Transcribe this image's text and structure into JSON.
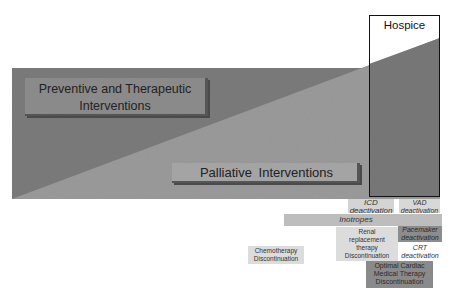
{
  "diagram": {
    "type": "care-transition-diagram",
    "regions": {
      "preventive": {
        "label": "Preventive and Therapeutic Interventions",
        "color": "#7b7b7b"
      },
      "palliative": {
        "label": "Palliative  Interventions",
        "color": "#9a9a9a"
      },
      "hospice": {
        "label": "Hospice"
      }
    },
    "labels": {
      "preventive_line1": "Preventive and Therapeutic",
      "preventive_line2": "Interventions",
      "palliative": "Palliative  Interventions",
      "hospice": "Hospice"
    },
    "interventions": [
      {
        "id": "icd",
        "line1": "ICD",
        "line2": "deactivation",
        "italic": true
      },
      {
        "id": "vad",
        "line1": "VAD",
        "line2": "deactivation",
        "italic": true
      },
      {
        "id": "inotropes",
        "line1": "Inotropes",
        "italic": true
      },
      {
        "id": "renal",
        "line1": "Renal",
        "line2": "replacement",
        "line3": "therapy",
        "line4": "Discontinuation",
        "italic": false
      },
      {
        "id": "pacemaker",
        "line1": "Pacemaker",
        "line2": "deactivation",
        "italic": true
      },
      {
        "id": "crt",
        "line1": "CRT",
        "line2": "deactivation",
        "italic": true
      },
      {
        "id": "chemo",
        "line1": "Chemotherapy",
        "line2": "Discontinuation",
        "italic": false
      },
      {
        "id": "omt",
        "line1": "Optimal Cardiac",
        "line2": "Medical Therapy",
        "line3": "Discontinuation",
        "italic": false
      }
    ]
  }
}
